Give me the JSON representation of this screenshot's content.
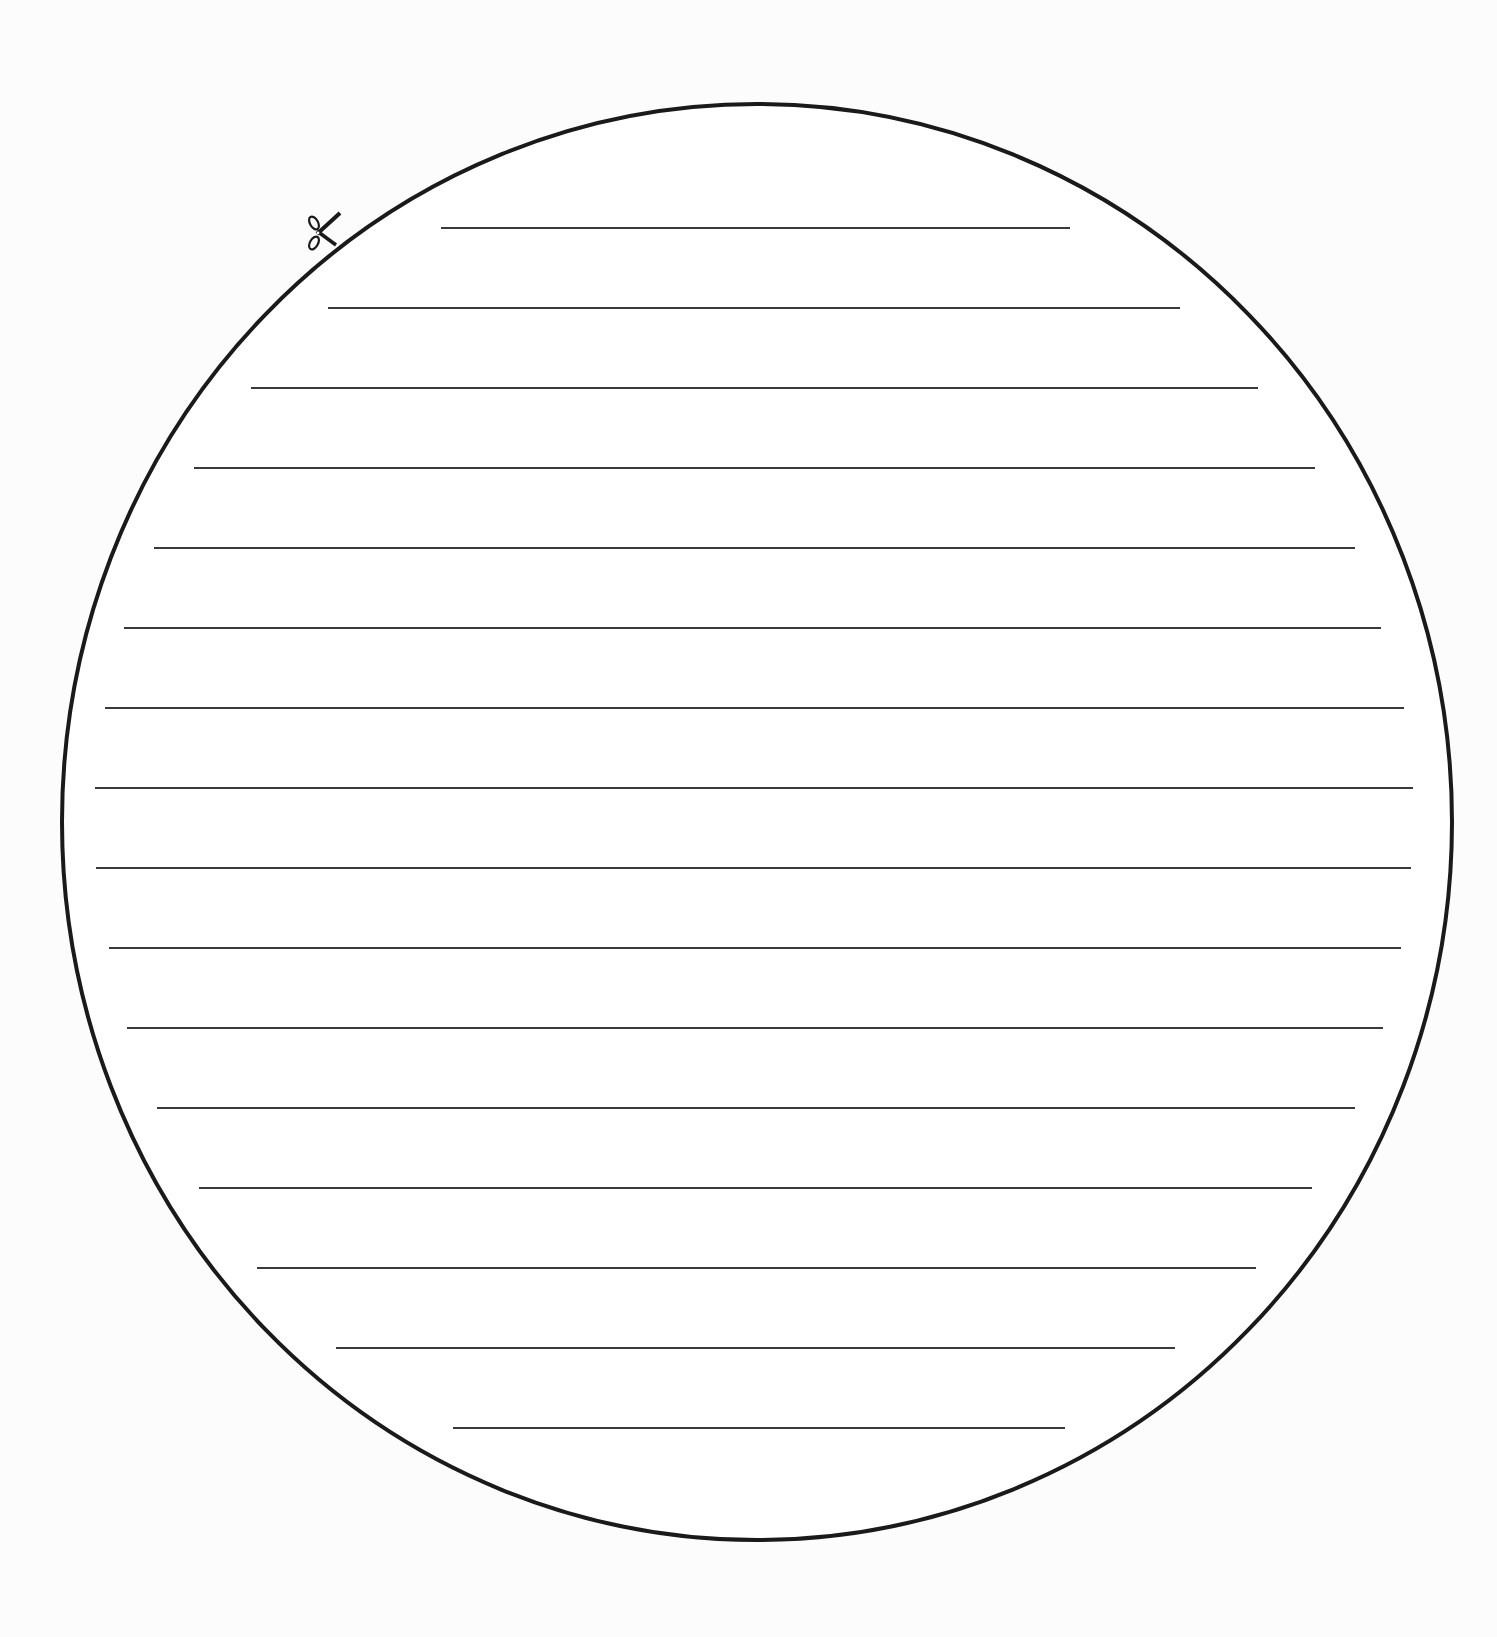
{
  "document": {
    "title": "Lined circle writing template",
    "background_color": "#fcfcfc",
    "ink_color": "#1a1a1a",
    "line_color": "#3a3a3a"
  },
  "circle": {
    "cx": 757,
    "cy": 822,
    "rx": 695,
    "ry": 718,
    "stroke_width": 4
  },
  "scissors": {
    "icon": "scissors-icon",
    "glyph": "✂",
    "x": 306,
    "y": 212,
    "width": 36,
    "height": 40,
    "rotation_deg": -45
  },
  "writing_lines": [
    {
      "y": 228,
      "x1": 441,
      "x2": 1070
    },
    {
      "y": 308,
      "x1": 328,
      "x2": 1180
    },
    {
      "y": 388,
      "x1": 251,
      "x2": 1258
    },
    {
      "y": 468,
      "x1": 194,
      "x2": 1315
    },
    {
      "y": 548,
      "x1": 154,
      "x2": 1355
    },
    {
      "y": 628,
      "x1": 124,
      "x2": 1381
    },
    {
      "y": 708,
      "x1": 105,
      "x2": 1404
    },
    {
      "y": 788,
      "x1": 95,
      "x2": 1413
    },
    {
      "y": 868,
      "x1": 96,
      "x2": 1411
    },
    {
      "y": 948,
      "x1": 109,
      "x2": 1401
    },
    {
      "y": 1028,
      "x1": 127,
      "x2": 1383
    },
    {
      "y": 1108,
      "x1": 157,
      "x2": 1355
    },
    {
      "y": 1188,
      "x1": 199,
      "x2": 1312
    },
    {
      "y": 1268,
      "x1": 257,
      "x2": 1256
    },
    {
      "y": 1348,
      "x1": 336,
      "x2": 1175
    },
    {
      "y": 1428,
      "x1": 453,
      "x2": 1065
    }
  ]
}
